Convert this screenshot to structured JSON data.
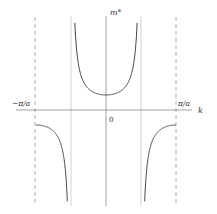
{
  "chart_data": {
    "type": "line",
    "title": "",
    "xlabel": "k",
    "ylabel": "m*",
    "x_ticks": [
      {
        "label": "−π/a",
        "value": -1.0
      },
      {
        "label": "0",
        "value": 0
      },
      {
        "label": "π/a",
        "value": 1.0
      }
    ],
    "x_unit": "π/a",
    "xlim": [
      -1.0,
      1.0
    ],
    "grid": false,
    "legend": null,
    "asymptotes_x": [
      -0.5,
      0.5
    ],
    "zone_boundaries_x": [
      -1.0,
      1.0
    ],
    "series": [
      {
        "name": "effective mass m*(k) ∝ 1/cos(ka)",
        "segments": [
          {
            "x": [
              -1.0,
              -0.9,
              -0.8,
              -0.7,
              -0.6,
              -0.55
            ],
            "y": [
              -1.0,
              -1.05,
              -1.24,
              -1.7,
              -3.24,
              -6.39
            ]
          },
          {
            "x": [
              -0.45,
              -0.4,
              -0.3,
              -0.2,
              -0.1,
              0,
              0.1,
              0.2,
              0.3,
              0.4,
              0.45
            ],
            "y": [
              6.39,
              3.24,
              1.7,
              1.24,
              1.05,
              1.0,
              1.05,
              1.24,
              1.7,
              3.24,
              6.39
            ]
          },
          {
            "x": [
              0.55,
              0.6,
              0.7,
              0.8,
              0.9,
              1.0
            ],
            "y": [
              -6.39,
              -3.24,
              -1.7,
              -1.24,
              -1.05,
              -1.0
            ]
          }
        ]
      }
    ]
  },
  "labels": {
    "y_axis": "m*",
    "x_axis": "k",
    "left_edge": "−π/a",
    "right_edge": "π/a",
    "origin": "0"
  }
}
